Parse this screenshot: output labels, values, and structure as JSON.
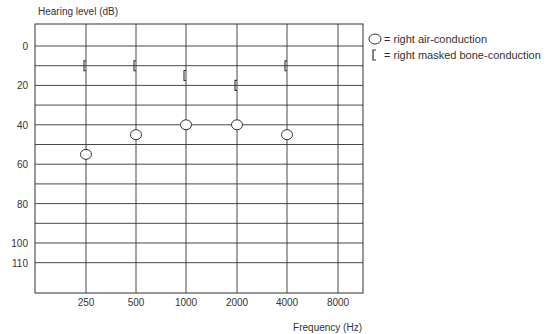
{
  "chart_data": {
    "type": "scatter",
    "title": "",
    "ylabel": "Hearing level (dB)",
    "xlabel": "Frequency (Hz)",
    "ylim": [
      -10,
      115
    ],
    "y_inverted": true,
    "y_tick_labels": [
      "0",
      "20",
      "40",
      "60",
      "80",
      "100",
      "110"
    ],
    "y_ticks": [
      0,
      20,
      40,
      60,
      80,
      100,
      110
    ],
    "y_gridlines": [
      0,
      10,
      20,
      30,
      40,
      50,
      60,
      70,
      80,
      90,
      100,
      110
    ],
    "categories": [
      "250",
      "500",
      "1000",
      "2000",
      "4000",
      "8000"
    ],
    "grid": true,
    "legend_position": "right",
    "series": [
      {
        "name": "right air-conduction",
        "marker": "circle",
        "x": [
          "250",
          "500",
          "1000",
          "2000",
          "4000"
        ],
        "values": [
          55,
          45,
          40,
          40,
          45
        ]
      },
      {
        "name": "right masked bone-conduction",
        "marker": "bracket-left",
        "x": [
          "250",
          "500",
          "1000",
          "2000",
          "4000"
        ],
        "values": [
          10,
          10,
          15,
          20,
          10
        ]
      }
    ]
  },
  "legend": {
    "items": [
      {
        "symbol": "circle",
        "text": "= right air-conduction"
      },
      {
        "symbol": "bracket",
        "text": "= right masked bone-conduction"
      }
    ]
  },
  "colors": {
    "line": "#333333",
    "text": "#333333",
    "background": "#ffffff"
  }
}
